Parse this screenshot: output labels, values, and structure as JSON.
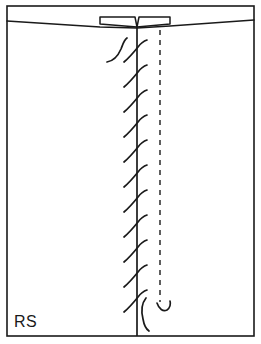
{
  "figure": {
    "background_color": "#ffffff",
    "ink_color": "#1a1a1a",
    "width": 261,
    "height": 344,
    "label": "RS",
    "label_position": {
      "x": 14,
      "y": 327
    },
    "frame": {
      "name": "outer-frame",
      "x": 7,
      "y": 6,
      "width": 247,
      "height": 330,
      "stroke_width": 1.6
    },
    "tissue_band": {
      "name": "tissue-band",
      "description": "thin horizontal band across top of frame with slightly sagging lower edge",
      "top_y": 6,
      "lower_edge_path": "M 7 21 L 100 27 L 137 28 L 170 26 L 254 20",
      "stroke_width": 1.5
    },
    "flaps": [
      {
        "name": "flap-left",
        "description": "left trapezoid flap converging to center point",
        "path": "M 100 17 L 135 17 L 137 27 L 100 24 Z"
      },
      {
        "name": "flap-right",
        "description": "right trapezoid flap converging to center point",
        "path": "M 139 17 L 170 17 L 170 24 L 137 27 Z"
      }
    ],
    "incision_line": {
      "name": "incision-line",
      "description": "vertical solid suture line running from band down to bottom frame",
      "x": 137,
      "y_start": 25,
      "y_end": 336,
      "stroke_width": 1.7
    },
    "reference_line": {
      "name": "reference-line-dashed",
      "description": "vertical dashed guideline right of incision",
      "x": 160,
      "y_start": 30,
      "y_end": 302,
      "stroke_width": 1.4,
      "dash_pattern": "5 5"
    },
    "stitches": {
      "name": "suture-stitches",
      "count": 11,
      "description": "S-curved diagonal stitch strokes crossing the incision line, running lower-left to upper-right",
      "first_y": 46,
      "spacing": 25,
      "stroke_width": 1.7,
      "paths": [
        "M 124 62 C 130 57 134 52 138 47 C 141 43 144 41 147 40",
        "M 124 87 C 130 82 134 77 138 72 C 141 68 144 66 147 65",
        "M 124 112 C 130 107 134 102 138 97 C 141 93 144 91 147 90",
        "M 124 137 C 130 132 134 127 138 122 C 141 118 144 116 147 115",
        "M 124 162 C 130 157 134 152 138 147 C 141 143 144 141 147 140",
        "M 124 187 C 130 182 134 177 138 172 C 141 168 144 166 147 165",
        "M 124 212 C 130 207 134 202 138 197 C 141 193 144 191 147 190",
        "M 124 237 C 130 232 134 227 138 222 C 141 218 144 216 147 215",
        "M 124 262 C 130 257 134 252 138 247 C 141 243 144 241 147 240",
        "M 124 287 C 130 282 134 277 138 272 C 141 268 144 266 147 265",
        "M 124 312 C 130 307 134 302 138 297 C 141 293 144 291 147 290"
      ]
    },
    "threads": [
      {
        "name": "thread-tail-top",
        "description": "curved suture thread tail above first stitch, left of incision",
        "path": "M 107 62 C 113 61 118 56 121 49 C 123 44 124 40 127 38"
      },
      {
        "name": "thread-tail-bottom",
        "description": "curved suture thread tail below last stitch, left of dashed line",
        "path": "M 146 298 C 142 303 141 311 143 319 C 144 325 146 329 149 331"
      },
      {
        "name": "thread-hook-dashed-end",
        "description": "small hook curl at lower end of dashed reference line",
        "path": "M 157 303 C 159 309 163 312 167 310 C 170 308 171 304 170 301"
      }
    ]
  }
}
